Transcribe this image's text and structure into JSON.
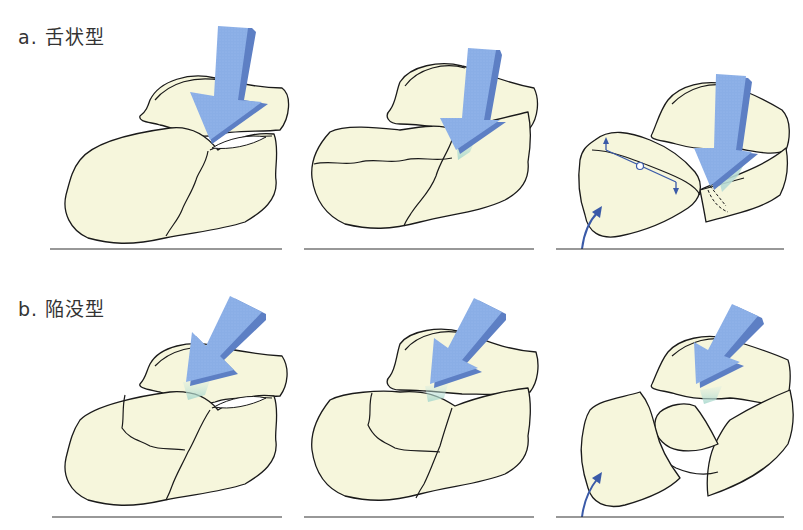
{
  "figure": {
    "rows": [
      {
        "id": "a",
        "label": "a.  舌状型",
        "fracture_type": "tongue type",
        "panels": [
          "stage-1",
          "stage-2",
          "stage-3"
        ]
      },
      {
        "id": "b",
        "label": "b.  陥没型",
        "fracture_type": "joint depression type",
        "panels": [
          "stage-1",
          "stage-2",
          "stage-3"
        ]
      }
    ],
    "colors": {
      "bone_fill": "#f6f6dc",
      "outline": "#1a1a1a",
      "arrow_fill": "#8aaee6",
      "arrow_shade": "#5d7fc4",
      "impact_zone": "#b8dcd4",
      "rotation_arrow": "#3a5aa8"
    }
  }
}
